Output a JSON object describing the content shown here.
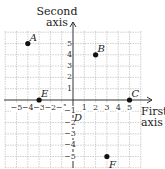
{
  "axes": {
    "y_title_line1": "Second",
    "y_title_line2": "axis",
    "x_title_line1": "First",
    "x_title_line2": "axis"
  },
  "x_ticks": [
    "−5",
    "−4",
    "−3",
    "−2",
    "−1",
    "1",
    "2",
    "3",
    "4",
    "5"
  ],
  "y_ticks": [
    "5",
    "4",
    "3",
    "2",
    "1",
    "−1",
    "−2",
    "−3",
    "−4",
    "−5"
  ],
  "points": [
    {
      "label": "A",
      "x": -4,
      "y": 5
    },
    {
      "label": "B",
      "x": 2,
      "y": 4
    },
    {
      "label": "C",
      "x": 5,
      "y": 0
    },
    {
      "label": "D",
      "x": 0,
      "y": -1
    },
    {
      "label": "E",
      "x": -3,
      "y": 0
    },
    {
      "label": "F",
      "x": 3,
      "y": -5
    }
  ]
}
